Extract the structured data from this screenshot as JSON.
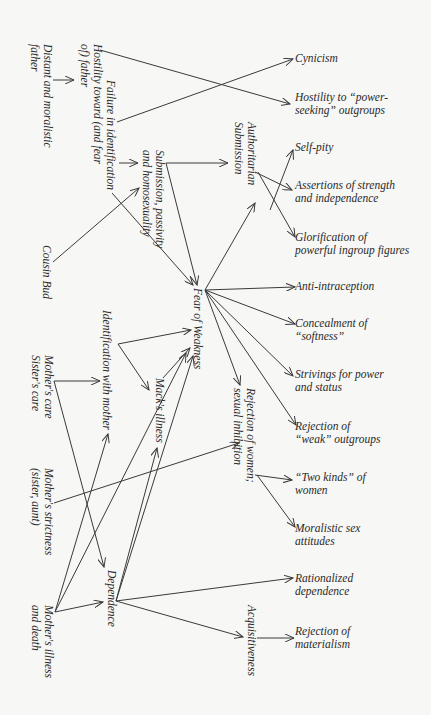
{
  "diagram": {
    "title": "",
    "nodes": {
      "distant_father": {
        "lines": [
          "Distant and moralistic",
          "father"
        ]
      },
      "failure_identification": {
        "lines": [
          "Failure in identification",
          "Hostility toward (and fear",
          "of) father"
        ]
      },
      "submission_passivity": {
        "lines": [
          "Submission, passivity",
          "and homosexuality"
        ]
      },
      "authoritarian_submission": {
        "lines": [
          "Authoritarian",
          "Submission"
        ]
      },
      "cousin_bud": {
        "lines": [
          "Cousin Bud"
        ]
      },
      "fear_of_weakness": {
        "lines": [
          "Fear of Weakness"
        ]
      },
      "identification_mother": {
        "lines": [
          "Identification with mother"
        ]
      },
      "macks_illness": {
        "lines": [
          "Mack's illness"
        ]
      },
      "mothers_care": {
        "lines": [
          "Mother's care",
          "Sister's care"
        ]
      },
      "rejection_women": {
        "lines": [
          "Rejection of women;",
          "sexual inhibition"
        ]
      },
      "mothers_strictness": {
        "lines": [
          "Mother's strictness",
          "(sister, aunt)"
        ]
      },
      "dependence": {
        "lines": [
          "Dependence"
        ]
      },
      "mothers_illness_death": {
        "lines": [
          "Mother's illness",
          "and death"
        ]
      },
      "acquisitiveness": {
        "lines": [
          "Acquisitiveness"
        ]
      },
      "cynicism": {
        "lines": [
          "Cynicism"
        ]
      },
      "hostility_power_seeking": {
        "lines": [
          "Hostility to “power-",
          "seeking” outgroups"
        ]
      },
      "self_pity": {
        "lines": [
          "Self-pity"
        ]
      },
      "assertions_strength": {
        "lines": [
          "Assertions of strength",
          "and independence"
        ]
      },
      "glorification_ingroup": {
        "lines": [
          "Glorification of",
          "powerful ingroup figures"
        ]
      },
      "anti_intraception": {
        "lines": [
          "Anti-intraception"
        ]
      },
      "concealment_softness": {
        "lines": [
          "Concealment of",
          "“softness”"
        ]
      },
      "strivings_power": {
        "lines": [
          "Strivings for power",
          "and status"
        ]
      },
      "rejection_weak_outgroups": {
        "lines": [
          "Rejection of",
          "“weak” outgroups"
        ]
      },
      "two_kinds_women": {
        "lines": [
          "“Two kinds” of",
          "women"
        ]
      },
      "moralistic_sex": {
        "lines": [
          "Moralistic sex",
          "attitudes"
        ]
      },
      "rationalized_dependence": {
        "lines": [
          "Rationalized",
          "dependence"
        ]
      },
      "rejection_materialism": {
        "lines": [
          "Rejection of",
          "materialism"
        ]
      }
    },
    "edges": [
      [
        "distant_father",
        "failure_identification"
      ],
      [
        "failure_identification",
        "cynicism"
      ],
      [
        "failure_identification",
        "hostility_power_seeking"
      ],
      [
        "failure_identification",
        "submission_passivity"
      ],
      [
        "failure_identification",
        "fear_of_weakness"
      ],
      [
        "cousin_bud",
        "submission_passivity"
      ],
      [
        "submission_passivity",
        "authoritarian_submission"
      ],
      [
        "submission_passivity",
        "fear_of_weakness"
      ],
      [
        "authoritarian_submission",
        "self_pity"
      ],
      [
        "authoritarian_submission",
        "assertions_strength"
      ],
      [
        "authoritarian_submission",
        "glorification_ingroup"
      ],
      [
        "fear_of_weakness",
        "authoritarian_submission"
      ],
      [
        "fear_of_weakness",
        "anti_intraception"
      ],
      [
        "fear_of_weakness",
        "concealment_softness"
      ],
      [
        "fear_of_weakness",
        "strivings_power"
      ],
      [
        "fear_of_weakness",
        "rejection_weak_outgroups"
      ],
      [
        "fear_of_weakness",
        "rejection_women"
      ],
      [
        "identification_mother",
        "fear_of_weakness"
      ],
      [
        "identification_mother",
        "macks_illness"
      ],
      [
        "macks_illness",
        "fear_of_weakness"
      ],
      [
        "mothers_care",
        "identification_mother"
      ],
      [
        "mothers_care",
        "dependence"
      ],
      [
        "mothers_strictness",
        "rejection_women"
      ],
      [
        "mothers_illness_death",
        "identification_mother"
      ],
      [
        "mothers_illness_death",
        "fear_of_weakness"
      ],
      [
        "mothers_illness_death",
        "dependence"
      ],
      [
        "dependence",
        "macks_illness"
      ],
      [
        "dependence",
        "fear_of_weakness"
      ],
      [
        "dependence",
        "rationalized_dependence"
      ],
      [
        "dependence",
        "acquisitiveness"
      ],
      [
        "rejection_women",
        "two_kinds_women"
      ],
      [
        "rejection_women",
        "moralistic_sex"
      ],
      [
        "acquisitiveness",
        "rejection_materialism"
      ]
    ]
  }
}
